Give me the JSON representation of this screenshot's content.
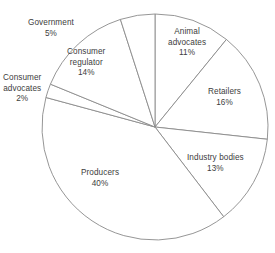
{
  "chart_data": {
    "type": "pie",
    "title": "",
    "subtitle": "",
    "xlabel": "",
    "ylabel": "",
    "legend_position": "none",
    "grid": false,
    "start_angle_deg": 0,
    "direction": "clockwise",
    "value_unit": "%",
    "total": 101,
    "categories": [
      "Animal advocates",
      "Retailers",
      "Industry bodies",
      "Producers",
      "Consumer advocates",
      "Consumer regulator",
      "Government"
    ],
    "values": [
      11,
      16,
      13,
      40,
      2,
      14,
      5
    ],
    "slices": [
      {
        "name": "Animal advocates",
        "value": 11,
        "value_label": "11%",
        "label_lines": [
          "Animal",
          "advocates"
        ],
        "label_x": 168,
        "label_y": 27
      },
      {
        "name": "Retailers",
        "value": 16,
        "value_label": "16%",
        "label_lines": [
          "Retailers"
        ],
        "label_x": 208,
        "label_y": 87
      },
      {
        "name": "Industry bodies",
        "value": 13,
        "value_label": "13%",
        "label_lines": [
          "Industry bodies"
        ],
        "label_x": 187,
        "label_y": 153
      },
      {
        "name": "Producers",
        "value": 40,
        "value_label": "40%",
        "label_lines": [
          "Producers"
        ],
        "label_x": 81,
        "label_y": 168
      },
      {
        "name": "Consumer advocates",
        "value": 2,
        "value_label": "2%",
        "label_lines": [
          "Consumer",
          "advocates"
        ],
        "label_x": 3,
        "label_y": 73
      },
      {
        "name": "Consumer regulator",
        "value": 14,
        "value_label": "14%",
        "label_lines": [
          "Consumer",
          "regulator"
        ],
        "label_x": 67,
        "label_y": 47
      },
      {
        "name": "Government",
        "value": 5,
        "value_label": "5%",
        "label_lines": [
          "Government"
        ],
        "label_x": 28,
        "label_y": 18
      }
    ],
    "geometry": {
      "center_x": 155,
      "center_y": 127,
      "radius": 113
    },
    "colors": {
      "slice_fill": "#ffffff",
      "slice_stroke": "#8a8a8a",
      "label_text": "#3d3d3d",
      "background": "#ffffff"
    }
  }
}
